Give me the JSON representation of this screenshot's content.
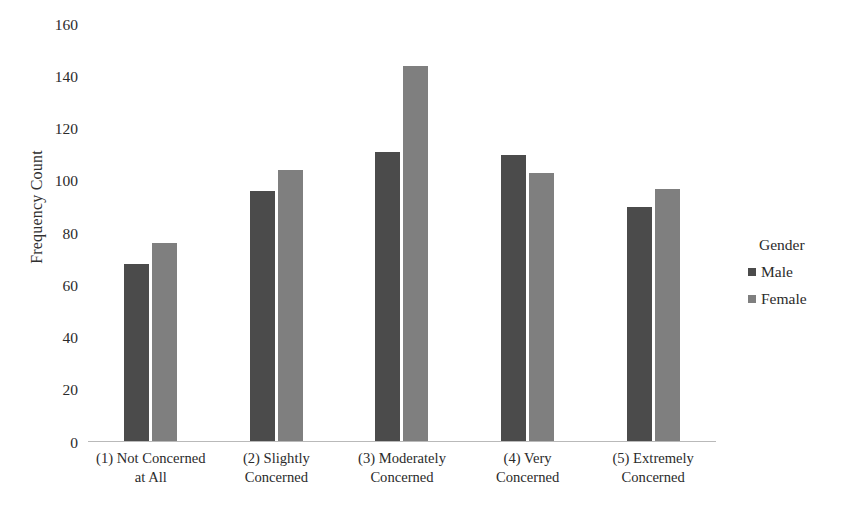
{
  "chart_data": {
    "type": "bar",
    "title": "",
    "xlabel": "",
    "ylabel": "Frequency Count",
    "ylim": [
      0,
      160
    ],
    "ytick_step": 20,
    "yticks": [
      160,
      140,
      120,
      100,
      80,
      60,
      40,
      20,
      0
    ],
    "grid": false,
    "legend_position": "right",
    "legend_title": "Gender",
    "categories": [
      "(1) Not Concerned at All",
      "(2) Slightly Concerned",
      "(3) Moderately Concerned",
      "(4) Very Concerned",
      "(5) Extremely Concerned"
    ],
    "category_lines": [
      [
        "(1) Not Concerned",
        "at All"
      ],
      [
        "(2) Slightly",
        "Concerned"
      ],
      [
        "(3) Moderately",
        "Concerned"
      ],
      [
        "(4) Very",
        "Concerned"
      ],
      [
        "(5) Extremely",
        "Concerned"
      ]
    ],
    "series": [
      {
        "name": "Male",
        "color": "#4b4b4b",
        "values": [
          68,
          96,
          111,
          110,
          90
        ]
      },
      {
        "name": "Female",
        "color": "#7f7f7f",
        "values": [
          76,
          104,
          144,
          103,
          97
        ]
      }
    ]
  },
  "legend": {
    "title": "Gender",
    "items": [
      {
        "label": "Male",
        "color": "#4b4b4b"
      },
      {
        "label": "Female",
        "color": "#7f7f7f"
      }
    ]
  },
  "axes": {
    "y_title": "Frequency Count"
  }
}
